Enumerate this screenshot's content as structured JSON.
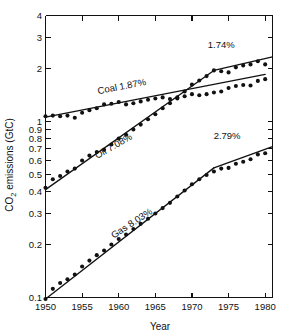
{
  "chart_data": {
    "type": "line",
    "title": "",
    "xlabel": "Year",
    "ylabel": "CO2 emissions (GtC)",
    "ylabel_parts": {
      "pre": "CO",
      "sub": "2",
      "post": " emissions (GtC)"
    },
    "xlim": [
      1950,
      1981
    ],
    "ylim": [
      0.1,
      4
    ],
    "yscale": "log",
    "xscale": "linear",
    "grid": false,
    "legend": "inline-labels",
    "xticks": [
      1950,
      1955,
      1960,
      1965,
      1970,
      1975,
      1980
    ],
    "xtick_labels": [
      "1950",
      "1955",
      "1960",
      "1965",
      "1970",
      "1975",
      "1980"
    ],
    "yticks": [
      0.1,
      0.2,
      0.3,
      0.4,
      0.5,
      0.6,
      0.7,
      0.8,
      0.9,
      1,
      2,
      3,
      4
    ],
    "ytick_labels": [
      "0.1",
      "0.2",
      "0.3",
      "0.4",
      "0.5",
      "0.6",
      "0.7",
      "0.8",
      "0.9",
      "1",
      "2",
      "3",
      "4"
    ],
    "x": [
      1950,
      1951,
      1952,
      1953,
      1954,
      1955,
      1956,
      1957,
      1958,
      1959,
      1960,
      1961,
      1962,
      1963,
      1964,
      1965,
      1966,
      1967,
      1968,
      1969,
      1970,
      1971,
      1972,
      1973,
      1974,
      1975,
      1976,
      1977,
      1978,
      1979,
      1980
    ],
    "series": [
      {
        "name": "Coal",
        "label": "Coal 1.87%",
        "growth_rate": "1.87%",
        "values": [
          1.07,
          1.08,
          1.07,
          1.08,
          1.05,
          1.12,
          1.16,
          1.19,
          1.25,
          1.26,
          1.29,
          1.25,
          1.27,
          1.3,
          1.33,
          1.35,
          1.37,
          1.34,
          1.35,
          1.39,
          1.43,
          1.41,
          1.43,
          1.46,
          1.48,
          1.55,
          1.59,
          1.61,
          1.6,
          1.7,
          1.74
        ]
      },
      {
        "name": "Oil",
        "label": "Oil 7.08%",
        "growth_rate": "7.08%",
        "annotation": "1.74%",
        "values": [
          0.42,
          0.47,
          0.49,
          0.52,
          0.54,
          0.6,
          0.64,
          0.67,
          0.69,
          0.74,
          0.8,
          0.84,
          0.9,
          0.96,
          1.03,
          1.1,
          1.19,
          1.27,
          1.37,
          1.48,
          1.62,
          1.71,
          1.81,
          1.95,
          1.93,
          1.9,
          2.03,
          2.08,
          2.11,
          2.2,
          2.11
        ]
      },
      {
        "name": "Gas",
        "label": "Gas 8.03%",
        "growth_rate": "8.03%",
        "annotation": "2.79%",
        "values": [
          0.098,
          0.112,
          0.121,
          0.127,
          0.135,
          0.15,
          0.162,
          0.174,
          0.185,
          0.2,
          0.215,
          0.228,
          0.245,
          0.262,
          0.28,
          0.3,
          0.322,
          0.345,
          0.375,
          0.405,
          0.44,
          0.47,
          0.497,
          0.52,
          0.54,
          0.545,
          0.575,
          0.59,
          0.61,
          0.65,
          0.66
        ]
      }
    ],
    "fit_segments": [
      {
        "series": "Coal",
        "x0": 1950,
        "y0": 1.06,
        "x1": 1980,
        "y1": 1.85,
        "rate_label": "1.87%"
      },
      {
        "series": "Oil",
        "x0": 1950,
        "y0": 0.41,
        "x1": 1973,
        "y1": 1.95,
        "rate_label": "7.08%"
      },
      {
        "series": "Oil",
        "x0": 1973,
        "y0": 1.95,
        "x1": 1981,
        "y1": 2.33,
        "rate_label": "1.74%"
      },
      {
        "series": "Gas",
        "x0": 1950,
        "y0": 0.098,
        "x1": 1973,
        "y1": 0.545,
        "rate_label": "8.03%"
      },
      {
        "series": "Gas",
        "x0": 1973,
        "y0": 0.545,
        "x1": 1981,
        "y1": 0.72,
        "rate_label": "2.79%"
      }
    ],
    "annotations": [
      {
        "text": "Coal 1.87%",
        "x": 1960.5,
        "y": 1.52,
        "rotation": -11
      },
      {
        "text": "Oil 7.08%",
        "x": 1959.5,
        "y": 0.7,
        "rotation": -30
      },
      {
        "text": "Gas 8.03%",
        "x": 1962.0,
        "y": 0.255,
        "rotation": -33
      },
      {
        "text": "1.74%",
        "x": 1974.0,
        "y": 2.62,
        "rotation": 0
      },
      {
        "text": "2.79%",
        "x": 1974.8,
        "y": 0.8,
        "rotation": 0
      }
    ]
  }
}
